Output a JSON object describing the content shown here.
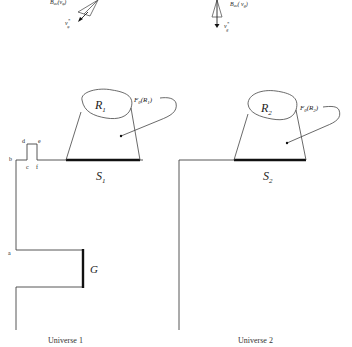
{
  "figure": {
    "top_left": {
      "label_main": "B",
      "label_sub": "ac",
      "label_arg": "(v",
      "label_arg_sub": "φ",
      "label_close": ")",
      "vector_label": "v",
      "vector_sup": "*",
      "vector_sub": "φ"
    },
    "top_right": {
      "label_main": "B",
      "label_sub": "ac",
      "label_arg": "( v",
      "label_arg_sub": "g",
      "label_close": ")",
      "vector_label": "v",
      "vector_sup": "*",
      "vector_sub": "g"
    },
    "universe1": {
      "caption": "Universe 1",
      "region": "R",
      "region_sub": "1",
      "map_label": "F",
      "map_sub": "θ",
      "map_arg": "(R",
      "map_arg_sub": "1",
      "map_close": ")",
      "surface": "S",
      "surface_sub": "1",
      "gate": "G",
      "points": [
        "a",
        "b",
        "c",
        "d",
        "e",
        "f"
      ]
    },
    "universe2": {
      "caption": "Universe 2",
      "region": "R",
      "region_sub": "2",
      "map_label": "F",
      "map_sub": "θ",
      "map_arg": "(R",
      "map_arg_sub": "2",
      "map_close": ")",
      "surface": "S",
      "surface_sub": "2"
    }
  }
}
